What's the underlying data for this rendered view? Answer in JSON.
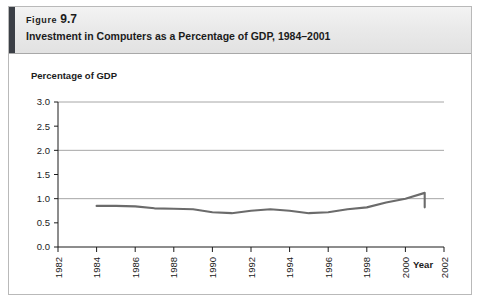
{
  "figure": {
    "label_word": "Figure",
    "number": "9.7",
    "title": "Investment in Computers as a Percentage of GDP, 1984–2001"
  },
  "chart_data": {
    "type": "line",
    "title": "Investment in Computers as a Percentage of GDP, 1984–2001",
    "xlabel": "Year",
    "ylabel": "Percentage of GDP",
    "xlim": [
      1982,
      2002
    ],
    "ylim": [
      0.0,
      3.0
    ],
    "yticks": [
      0.0,
      0.5,
      1.0,
      1.5,
      2.0,
      2.5,
      3.0
    ],
    "ytick_labels": [
      "0.0",
      "0.5",
      "1.0",
      "1.5",
      "2.0",
      "2.5",
      "3.0"
    ],
    "gridlines_y": [
      1.0,
      2.0,
      3.0
    ],
    "grid": true,
    "legend": "none",
    "xticks": [
      1982,
      1984,
      1986,
      1988,
      1990,
      1992,
      1994,
      1996,
      1998,
      2000,
      2002
    ],
    "xtick_labels": [
      "1982",
      "1984",
      "1986",
      "1988",
      "1990",
      "1992",
      "1994",
      "1996",
      "1998",
      "2000",
      "2002"
    ],
    "xtick_rotation": 90,
    "series": [
      {
        "name": "Investment in computers as a percentage of GDP",
        "color": "#6b6b6b",
        "x": [
          1984,
          1985,
          1986,
          1987,
          1988,
          1989,
          1990,
          1991,
          1992,
          1993,
          1994,
          1995,
          1996,
          1997,
          1998,
          1999,
          2000,
          2001
        ],
        "values": [
          0.85,
          0.85,
          0.84,
          0.8,
          0.79,
          0.78,
          0.72,
          0.7,
          0.75,
          0.78,
          0.75,
          0.7,
          0.72,
          0.78,
          0.82,
          0.92,
          1.0,
          1.12
        ]
      }
    ],
    "series_tail": {
      "x": [
        2001
      ],
      "values": [
        0.82
      ]
    }
  },
  "colors": {
    "line": "#6b6b6b",
    "grid": "#8f8f8f",
    "axis": "#1b1b1b",
    "header_accent": "#3b3f46",
    "frame": "#b9b9b9"
  }
}
